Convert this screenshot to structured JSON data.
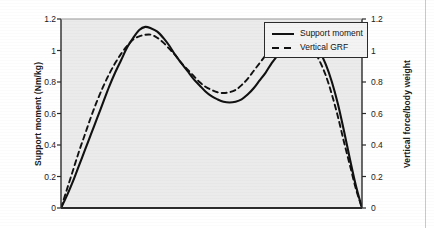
{
  "chart_data": {
    "type": "line",
    "title": "",
    "subtitle": "",
    "xlabel": "",
    "ylabel": "Support moment (Nm/kg)",
    "ylabel_right": "Vertical force/body weight",
    "xlim": [
      0,
      100
    ],
    "ylim": [
      0,
      1.2
    ],
    "ylim_right": [
      0,
      1.2
    ],
    "grid": false,
    "legend_position": "top-right",
    "x_ticks": [],
    "y_ticks": [
      0,
      0.2,
      0.4,
      0.6,
      0.8,
      1,
      1.2
    ],
    "y_tick_labels": [
      "0",
      "0.2",
      "0.4",
      "0.6",
      "0.8",
      "1",
      "1.2"
    ],
    "y_ticks_right": [
      0,
      0.2,
      0.4,
      0.6,
      0.8,
      1,
      1.2
    ],
    "y_tick_labels_right": [
      "0",
      "0.2",
      "0.4",
      "0.6",
      "0.8",
      "1",
      "1.2"
    ],
    "plot_background": "#ebebeb",
    "axis_color": "#2b2b2b",
    "series": [
      {
        "name": "Support moment",
        "style": "solid",
        "color": "#111111",
        "x": [
          0,
          2,
          4,
          6,
          8,
          10,
          12,
          14,
          16,
          18,
          20,
          22,
          24,
          26,
          28,
          30,
          32,
          34,
          36,
          38,
          40,
          42,
          44,
          46,
          48,
          50,
          52,
          54,
          56,
          58,
          60,
          62,
          64,
          66,
          68,
          70,
          72,
          74,
          76,
          78,
          80,
          82,
          84,
          86,
          88,
          90,
          92,
          94,
          96,
          98,
          100
        ],
        "y": [
          0.0,
          0.08,
          0.17,
          0.27,
          0.37,
          0.47,
          0.57,
          0.67,
          0.77,
          0.86,
          0.94,
          1.02,
          1.08,
          1.13,
          1.15,
          1.14,
          1.12,
          1.08,
          1.03,
          0.97,
          0.92,
          0.87,
          0.82,
          0.78,
          0.74,
          0.71,
          0.69,
          0.675,
          0.67,
          0.675,
          0.69,
          0.72,
          0.76,
          0.81,
          0.86,
          0.92,
          0.97,
          1.02,
          1.05,
          1.075,
          1.08,
          1.07,
          1.04,
          0.99,
          0.91,
          0.8,
          0.66,
          0.49,
          0.31,
          0.14,
          0.0
        ]
      },
      {
        "name": "Vertical GRF",
        "style": "dashed",
        "color": "#111111",
        "x": [
          0,
          2,
          4,
          6,
          8,
          10,
          12,
          14,
          16,
          18,
          20,
          22,
          24,
          26,
          28,
          30,
          32,
          34,
          36,
          38,
          40,
          42,
          44,
          46,
          48,
          50,
          52,
          54,
          56,
          58,
          60,
          62,
          64,
          66,
          68,
          70,
          72,
          74,
          76,
          78,
          80,
          82,
          84,
          86,
          88,
          90,
          92,
          94,
          96,
          98,
          100
        ],
        "y": [
          0.0,
          0.12,
          0.24,
          0.36,
          0.47,
          0.58,
          0.68,
          0.77,
          0.85,
          0.92,
          0.98,
          1.03,
          1.07,
          1.09,
          1.1,
          1.1,
          1.08,
          1.05,
          1.01,
          0.97,
          0.92,
          0.88,
          0.84,
          0.8,
          0.77,
          0.75,
          0.735,
          0.73,
          0.735,
          0.75,
          0.78,
          0.82,
          0.87,
          0.92,
          0.97,
          1.01,
          1.05,
          1.08,
          1.09,
          1.09,
          1.08,
          1.05,
          1.0,
          0.93,
          0.84,
          0.72,
          0.58,
          0.42,
          0.27,
          0.12,
          0.0
        ]
      }
    ],
    "peaks": {
      "support_moment_first_peak": 1.15,
      "support_moment_valley": 0.67,
      "support_moment_second_peak": 1.08,
      "vertical_grf_first_peak": 1.1,
      "vertical_grf_valley": 0.73,
      "vertical_grf_second_peak": 1.09
    }
  },
  "legend": {
    "items": [
      {
        "label": "Support moment",
        "style": "solid"
      },
      {
        "label": "Vertical GRF",
        "style": "dashed"
      }
    ]
  },
  "axes": {
    "left_title": "Support moment (Nm/kg)",
    "right_title": "Vertical force/body weight"
  }
}
